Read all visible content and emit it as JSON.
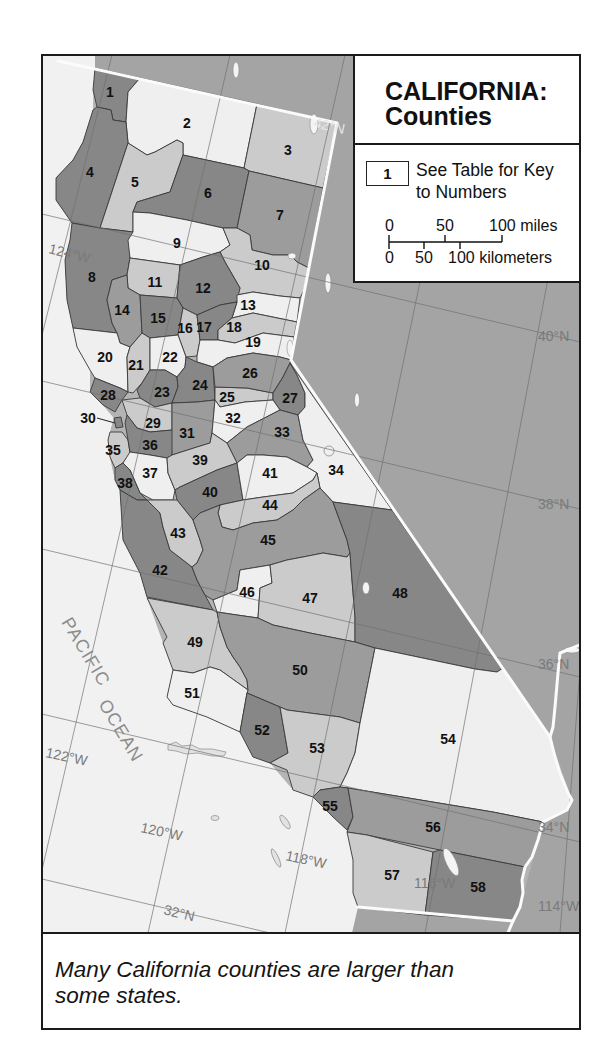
{
  "legend": {
    "title_line1": "CALIFORNIA:",
    "title_line2": "Counties",
    "key": {
      "number": "1",
      "text_line1": "See Table for Key",
      "text_line2": "to Numbers"
    },
    "scale": {
      "miles_labels": [
        "0",
        "50",
        "100 miles"
      ],
      "km_labels": [
        "0",
        "50",
        "100 kilometers"
      ]
    }
  },
  "caption": {
    "line1": "Many California counties are larger than",
    "line2": "some states."
  },
  "map": {
    "shades": {
      "dark": "#878787",
      "medium": "#9c9c9c",
      "light": "#cbcbcb",
      "white": "#efefef"
    },
    "land_color": "#a4a4a4",
    "ocean_color": "#f1f1f1",
    "ocean_label": {
      "line1": "PACIFIC",
      "line2": "OCEAN"
    },
    "graticule_labels": {
      "lat_42": "42°N",
      "lat_40": "40°N",
      "lat_38": "38°N",
      "lat_36": "36°N",
      "lat_34": "34°N",
      "lat_32": "32°N",
      "lon_124": "124°W",
      "lon_122": "122°W",
      "lon_120": "120°W",
      "lon_118": "118°W",
      "lon_116": "116°W",
      "lon_114": "114°W"
    },
    "counties": [
      {
        "num": "1",
        "shade": "dark",
        "label": [
          110,
          92
        ],
        "points": "95,68 140,78 128,92 126,122 113,120 111,110 97,107 93,90"
      },
      {
        "num": "2",
        "shade": "white",
        "label": [
          187,
          123
        ],
        "points": "140,78 257,104 244,168 183,155 183,143 177,140 155,152 147,155 128,143 126,122 128,92"
      },
      {
        "num": "3",
        "shade": "light",
        "label": [
          288,
          150
        ],
        "points": "257,104 337,123 323,188 249,171 244,168"
      },
      {
        "num": "4",
        "shade": "dark",
        "label": [
          90,
          172
        ],
        "points": "97,107 111,110 113,120 126,122 128,143 100,228 72,223 56,200 56,178 73,160 83,142 93,110"
      },
      {
        "num": "5",
        "shade": "light",
        "label": [
          135,
          182
        ],
        "points": "128,143 147,155 155,152 177,140 183,143 183,155 170,192 137,202 133,212 133,232 100,228"
      },
      {
        "num": "6",
        "shade": "dark",
        "label": [
          208,
          193
        ],
        "points": "183,155 244,168 249,171 237,228 223,228 187,220 150,213 133,212 137,202 170,192"
      },
      {
        "num": "7",
        "shade": "medium",
        "label": [
          280,
          215
        ],
        "points": "249,171 323,188 309,268 297,262 290,255 273,255 252,250 250,235 237,228"
      },
      {
        "num": "8",
        "shade": "dark",
        "label": [
          92,
          277
        ],
        "points": "72,223 100,228 133,232 130,258 127,275 112,280 107,300 112,323 117,333 73,328 67,300 65,260 70,240"
      },
      {
        "num": "9",
        "shade": "white",
        "label": [
          177,
          243
        ],
        "points": "133,212 150,213 187,220 223,228 230,245 220,252 203,257 180,265 130,258 128,240 133,232"
      },
      {
        "num": "10",
        "shade": "light",
        "label": [
          262,
          265
        ],
        "points": "223,228 237,228 250,235 252,250 273,255 290,255 297,262 309,268 304,290 300,298 280,296 253,292 237,295 240,288 225,262 220,252 230,245"
      },
      {
        "num": "11",
        "shade": "light",
        "label": [
          155,
          282
        ],
        "points": "130,258 180,265 177,298 140,295 128,288 127,275"
      },
      {
        "num": "12",
        "shade": "dark",
        "label": [
          203,
          288
        ],
        "points": "180,265 203,257 220,252 225,262 240,288 237,302 220,305 197,315 183,308 177,298"
      },
      {
        "num": "13",
        "shade": "white",
        "label": [
          248,
          305
        ],
        "points": "237,302 237,295 253,292 280,296 300,298 297,322 253,313 232,318"
      },
      {
        "num": "14",
        "shade": "medium",
        "label": [
          122,
          310
        ],
        "points": "112,280 127,275 128,288 140,295 142,333 130,347 120,343 117,333 112,323 107,300"
      },
      {
        "num": "15",
        "shade": "dark",
        "label": [
          158,
          318
        ],
        "points": "140,295 177,298 183,308 178,335 150,338 142,333"
      },
      {
        "num": "16",
        "shade": "light",
        "label": [
          185,
          328
        ],
        "points": "183,308 197,315 200,340 197,356 186,357 178,335"
      },
      {
        "num": "17",
        "shade": "dark",
        "label": [
          204,
          327
        ],
        "points": "197,315 220,305 237,302 232,318 218,330 218,340 200,340"
      },
      {
        "num": "18",
        "shade": "light",
        "label": [
          234,
          327
        ],
        "points": "232,318 253,313 297,322 294,337 263,333 235,343 218,340 218,330"
      },
      {
        "num": "19",
        "shade": "white",
        "label": [
          253,
          342
        ],
        "points": "200,340 218,340 235,343 263,333 294,337 291,360 280,357 253,353 227,358 213,367 197,362 197,356"
      },
      {
        "num": "20",
        "shade": "white",
        "label": [
          105,
          357
        ],
        "points": "73,328 117,333 120,343 130,347 127,357 128,392 120,388 95,378 90,370 77,347"
      },
      {
        "num": "21",
        "shade": "light",
        "label": [
          136,
          365
        ],
        "points": "127,357 130,347 142,333 150,338 150,370 142,383 133,393 128,392"
      },
      {
        "num": "22",
        "shade": "white",
        "label": [
          170,
          357
        ],
        "points": "150,338 178,335 186,357 185,367 177,377 165,370 150,370"
      },
      {
        "num": "23",
        "shade": "dark",
        "label": [
          162,
          392
        ],
        "points": "150,370 165,370 177,377 178,387 172,403 155,407 140,398 137,390 142,383"
      },
      {
        "num": "24",
        "shade": "dark",
        "label": [
          200,
          385
        ],
        "points": "186,357 197,362 213,367 215,400 197,402 172,403 178,387 177,377 185,367"
      },
      {
        "num": "25",
        "shade": "light",
        "label": [
          227,
          397
        ],
        "points": "215,387 247,388 273,393 273,400 245,402 220,407 215,400"
      },
      {
        "num": "26",
        "shade": "medium",
        "label": [
          250,
          373
        ],
        "points": "213,367 227,358 253,353 280,357 291,360 290,363 283,377 273,393 247,388 215,387"
      },
      {
        "num": "27",
        "shade": "dark",
        "label": [
          290,
          398
        ],
        "points": "283,377 290,363 297,375 305,393 305,407 298,415 280,410 273,400 273,393"
      },
      {
        "num": "28",
        "shade": "dark",
        "label": [
          108,
          395
        ],
        "points": "95,378 120,388 128,392 122,400 115,412 103,405 90,392"
      },
      {
        "num": "29",
        "shade": "light",
        "label": [
          153,
          423
        ],
        "points": "122,400 140,398 155,407 172,403 172,430 150,432 137,428 127,415"
      },
      {
        "num": "30",
        "shade": "dark",
        "label": [
          88,
          418
        ],
        "points": "114,418 121,417 123,427 116,428"
      },
      {
        "num": "31",
        "shade": "medium",
        "label": [
          187,
          433
        ],
        "points": "172,403 197,402 215,400 212,433 210,443 197,447 172,455 170,432 172,430"
      },
      {
        "num": "32",
        "shade": "white",
        "label": [
          233,
          418
        ],
        "points": "215,400 220,407 245,402 273,400 280,410 247,427 227,443 212,433"
      },
      {
        "num": "33",
        "shade": "medium",
        "label": [
          282,
          432
        ],
        "points": "280,410 298,415 303,440 313,460 307,467 287,457 263,455 247,455 237,463 227,443 247,427"
      },
      {
        "num": "34",
        "shade": "white",
        "label": [
          336,
          470
        ],
        "points": "290,363 392,510 333,502 320,488 317,473 307,467 313,460 303,440 298,415 305,407 305,393 297,375"
      },
      {
        "num": "35",
        "shade": "light",
        "label": [
          113,
          450
        ],
        "points": "110,432 122,432 128,440 130,453 123,463 115,468 110,457 108,440"
      },
      {
        "num": "36",
        "shade": "dark",
        "label": [
          150,
          445
        ],
        "points": "127,415 137,428 150,432 172,430 172,455 167,458 150,455 130,452 128,440 125,423"
      },
      {
        "num": "37",
        "shade": "white",
        "label": [
          150,
          473
        ],
        "points": "130,452 150,455 167,458 168,473 175,490 173,500 153,500 140,493 130,470 123,463"
      },
      {
        "num": "38",
        "shade": "dark",
        "label": [
          125,
          483
        ],
        "points": "115,468 123,463 130,470 140,493 147,500 137,500 120,490 115,480"
      },
      {
        "num": "39",
        "shade": "light",
        "label": [
          200,
          460
        ],
        "points": "172,455 197,447 210,443 212,433 227,443 237,463 217,470 180,487 175,490 168,473 167,458"
      },
      {
        "num": "40",
        "shade": "dark",
        "label": [
          210,
          492
        ],
        "points": "180,487 217,470 237,463 243,500 220,505 200,513 193,520 177,500 175,490"
      },
      {
        "num": "41",
        "shade": "white",
        "label": [
          270,
          473
        ],
        "points": "237,463 247,455 263,455 287,457 307,467 317,473 313,480 293,493 263,497 243,500"
      },
      {
        "num": "42",
        "shade": "dark",
        "label": [
          160,
          570
        ],
        "points": "120,490 137,500 147,500 160,513 163,527 170,550 183,560 192,567 197,580 205,595 213,610 147,597 140,573 123,540"
      },
      {
        "num": "43",
        "shade": "light",
        "label": [
          178,
          533
        ],
        "points": "147,500 173,500 177,500 193,520 200,540 203,550 197,563 192,567 183,560 170,550 163,527 160,513"
      },
      {
        "num": "44",
        "shade": "light",
        "label": [
          270,
          505
        ],
        "points": "220,505 243,500 263,497 293,493 313,480 317,473 320,488 303,500 293,510 277,520 253,523 233,530 222,527 218,513"
      },
      {
        "num": "45",
        "shade": "medium",
        "label": [
          268,
          540
        ],
        "points": "193,520 200,513 220,505 218,513 222,527 233,530 253,523 277,520 293,510 303,500 320,488 333,502 337,513 347,540 350,553 347,557 323,553 303,557 287,560 270,565 240,570 237,590 213,600 205,595 197,580 192,567 197,563 203,550 200,540"
      },
      {
        "num": "46",
        "shade": "white",
        "label": [
          247,
          592
        ],
        "points": "213,600 237,590 240,570 270,565 272,583 260,588 258,618 237,615 217,612"
      },
      {
        "num": "47",
        "shade": "light",
        "label": [
          310,
          598
        ],
        "points": "270,565 287,560 303,557 323,553 347,557 350,553 352,580 355,617 355,642 310,633 273,625 258,618 260,588 272,583"
      },
      {
        "num": "48",
        "shade": "dark",
        "label": [
          400,
          593
        ],
        "points": "333,502 392,510 503,668 497,672 475,669 375,648 355,642 355,617 352,580 350,553 347,540 337,513"
      },
      {
        "num": "49",
        "shade": "light",
        "label": [
          195,
          642
        ],
        "points": "147,598 213,610 217,612 220,627 227,647 233,657 240,667 247,680 248,690 220,670 210,667 193,673 173,670 163,643 167,637"
      },
      {
        "num": "50",
        "shade": "medium",
        "label": [
          300,
          670
        ],
        "points": "217,612 237,615 258,618 273,625 310,633 355,642 375,648 360,723 340,717 287,710 247,693 248,690 247,680 240,667 233,657 227,647 220,627"
      },
      {
        "num": "51",
        "shade": "white",
        "label": [
          192,
          693
        ],
        "points": "173,670 193,673 210,667 220,670 248,690 247,693 240,732 207,717 173,705 167,697"
      },
      {
        "num": "52",
        "shade": "dark",
        "label": [
          262,
          730
        ],
        "points": "247,693 280,707 288,753 270,763 253,757 240,732"
      },
      {
        "num": "53",
        "shade": "light",
        "label": [
          317,
          748
        ],
        "points": "280,707 287,710 340,717 360,723 355,753 347,773 340,787 320,790 313,797 293,790 287,770 270,763 288,753"
      },
      {
        "num": "54",
        "shade": "white",
        "label": [
          448,
          739
        ],
        "points": "375,648 475,669 497,672 503,668 550,737 555,757 560,773 568,793 572,800 567,810 553,817 543,822 493,812 348,788 340,787 347,773 355,753 360,723"
      },
      {
        "num": "55",
        "shade": "dark",
        "label": [
          330,
          806
        ],
        "points": "313,797 320,790 340,787 348,788 353,817 347,830 333,817"
      },
      {
        "num": "56",
        "shade": "medium",
        "label": [
          433,
          827
        ],
        "points": "348,788 493,812 543,822 538,840 532,857 525,867 440,850 367,835 347,832 353,817"
      },
      {
        "num": "57",
        "shade": "light",
        "label": [
          392,
          875
        ],
        "points": "347,832 367,835 433,852 425,915 358,907 353,893 353,860"
      },
      {
        "num": "58",
        "shade": "dark",
        "label": [
          478,
          887
        ],
        "points": "433,852 440,850 525,867 522,880 523,893 520,907 513,921 425,915"
      }
    ]
  }
}
